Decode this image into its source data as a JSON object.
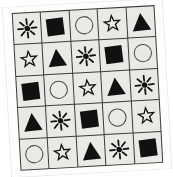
{
  "figure": {
    "title": "",
    "background_color": "#ffffff",
    "card_color": "#fdfdfc",
    "cell_color": "#e9e9e6",
    "line_color": "#3a3a3a",
    "ink_color": "#111111",
    "rotation_degrees": "-3.2"
  },
  "grid": {
    "rows": 5,
    "columns": 5,
    "symbol_legend": [
      {
        "key": "sunburst",
        "label": "sunburst",
        "fill": "filled"
      },
      {
        "key": "filled-square",
        "label": "filled square",
        "fill": "filled"
      },
      {
        "key": "outline-circle",
        "label": "outline circle",
        "fill": "outline"
      },
      {
        "key": "outline-star",
        "label": "outline star",
        "fill": "outline"
      },
      {
        "key": "filled-triangle",
        "label": "filled triangle",
        "fill": "filled"
      }
    ],
    "cells": [
      [
        "sunburst",
        "filled-square",
        "outline-circle",
        "outline-star",
        "filled-triangle"
      ],
      [
        "outline-star",
        "filled-triangle",
        "sunburst",
        "filled-square",
        "outline-circle"
      ],
      [
        "filled-square",
        "outline-circle",
        "outline-star",
        "filled-triangle",
        "sunburst"
      ],
      [
        "filled-triangle",
        "sunburst",
        "filled-square",
        "outline-circle",
        "outline-star"
      ],
      [
        "outline-circle",
        "outline-star",
        "filled-triangle",
        "sunburst",
        "filled-square"
      ]
    ]
  }
}
